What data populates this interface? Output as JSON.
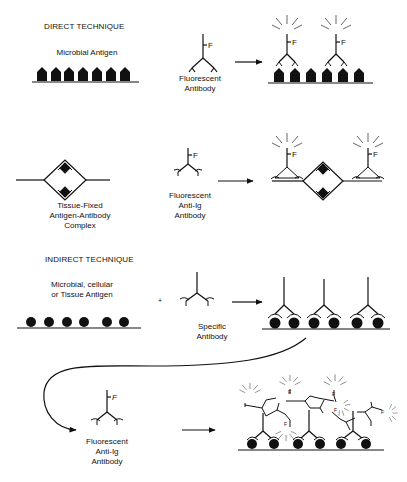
{
  "diagram": {
    "sections": [
      {
        "heading": "DIRECT TECHNIQUE",
        "rows": [
          {
            "antigen_label": "Microbial Antigen",
            "antigen_count": 7,
            "reagent_label": "Fluorescent\nAntibody",
            "result": "Fluorescent antibodies bound to antigens (2 antibodies, 6 antigens)"
          },
          {
            "antigen_label": "Tissue-Fixed\nAntigen-Antibody\nComplex",
            "reagent_label": "Fluorescent\nAnti-Ig\nAntibody",
            "result": "Fluorescent anti-Ig antibodies bound to both sides of complex"
          }
        ]
      },
      {
        "heading": "INDIRECT TECHNIQUE",
        "rows": [
          {
            "antigen_label": "Microbial, cellular\nor Tissue Antigen",
            "antigen_count": 6,
            "operator": "+",
            "reagent_label": "Specific\nAntibody",
            "result": "Three specific antibodies bound to antigen pairs"
          },
          {
            "reagent_label": "Fluorescent\nAnti-Ig\nAntibody",
            "result": "Multiple fluorescent anti-Ig antibodies bound to specific antibodies"
          }
        ]
      }
    ],
    "fluorophore_letter": "F",
    "colors": {
      "ink": "#111111",
      "background": "#ffffff",
      "glow_rays": "#555555"
    }
  }
}
